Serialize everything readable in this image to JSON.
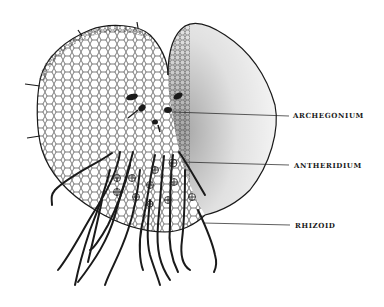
{
  "figure": {
    "labels": {
      "archegonium": "ARCHEGONIUM",
      "antheridium": "ANTHERIDIUM",
      "rhizoid": "RHIZOID"
    },
    "colors": {
      "ink": "#1a1a1a",
      "background": "#ffffff"
    }
  }
}
